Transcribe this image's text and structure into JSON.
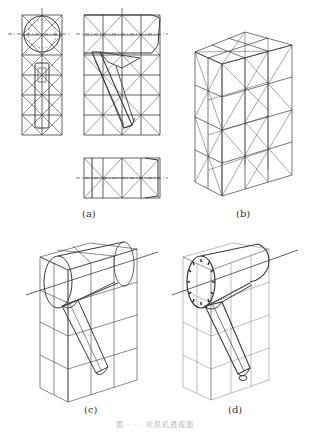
{
  "figure": {
    "panels": [
      {
        "id": "a",
        "label": "(a)",
        "description": "Orthographic views with square grid and diagonals: front view (circle with dial), side view (angled handle), top view"
      },
      {
        "id": "b",
        "label": "(b)",
        "description": "Perspective grid box with diagonals"
      },
      {
        "id": "c",
        "label": "(c)",
        "description": "Perspective box with hair dryer outline drawn in"
      },
      {
        "id": "d",
        "label": "(d)",
        "description": "Completed perspective drawing of hair dryer with dial details"
      }
    ],
    "caption": "图 · · · 吹风机透视图",
    "colors": {
      "line": "#3a3a3a",
      "faint": "#8a8a8a",
      "background": "#ffffff"
    }
  }
}
